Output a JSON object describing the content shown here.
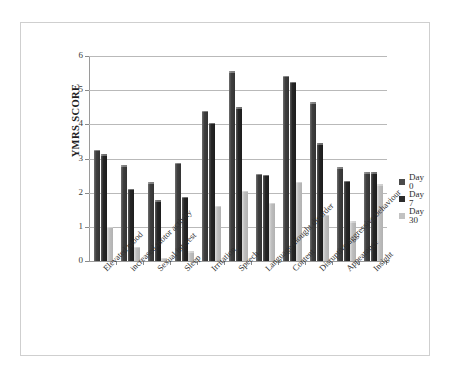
{
  "chart_data": {
    "type": "bar",
    "title": "",
    "xlabel": "",
    "ylabel": "YMRS SCORE",
    "ylim": [
      0,
      6
    ],
    "yticks": [
      "0",
      "1",
      "2",
      "3",
      "4",
      "5",
      "6"
    ],
    "grid": "horizontal",
    "legend_position": "right",
    "categories": [
      "Elevated mood",
      "increased motor activity",
      "Sexual interest",
      "Sleep",
      "Irritation",
      "Speech",
      "Language thought disorder",
      "Content",
      "Disruptive aggressive behaviour",
      "Appearance",
      "Insight"
    ],
    "series": [
      {
        "name": "Day 0",
        "color": "#4a4a4a",
        "values": [
          3.25,
          2.8,
          2.3,
          2.88,
          4.4,
          5.55,
          2.55,
          5.42,
          4.65,
          2.75,
          2.6
        ]
      },
      {
        "name": "Day 7",
        "color": "#2c2c2c",
        "values": [
          3.12,
          2.12,
          1.78,
          1.88,
          4.05,
          4.5,
          2.53,
          5.25,
          3.45,
          2.35,
          2.6
        ]
      },
      {
        "name": "Day 30",
        "color": "#c2c2c2",
        "values": [
          1.0,
          0.42,
          0.1,
          0.28,
          1.62,
          2.05,
          1.7,
          2.32,
          1.35,
          1.17,
          2.25
        ]
      }
    ]
  },
  "legend": {
    "items": [
      {
        "label": "Day 0"
      },
      {
        "label": "Day 7"
      },
      {
        "label": "Day 30"
      }
    ]
  }
}
